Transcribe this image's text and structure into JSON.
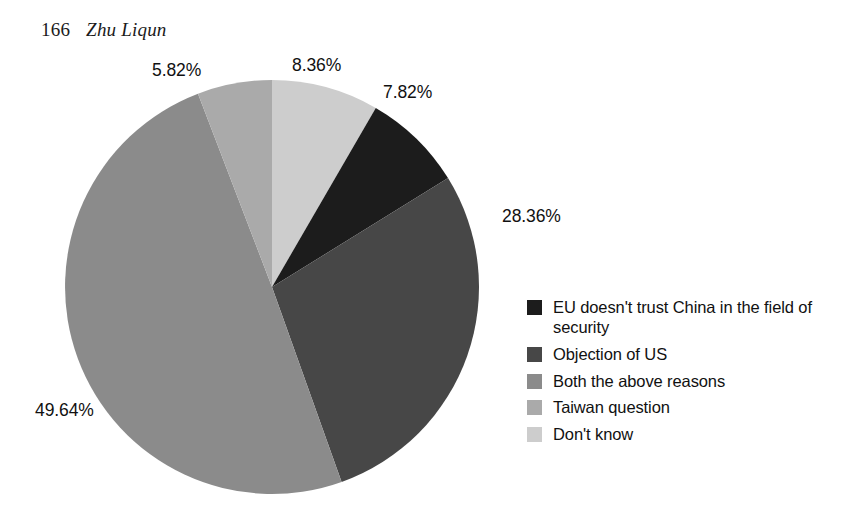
{
  "running_head": {
    "folio": "166",
    "author": "Zhu Liqun"
  },
  "chart_data": {
    "type": "pie",
    "title": "",
    "subtitle": "",
    "xlabel": "",
    "ylabel": "",
    "legend_position": "right",
    "grid": false,
    "units": "percent",
    "total": 100.0,
    "start_angle_deg": 0,
    "direction": "clockwise",
    "categories": [
      "Don't know",
      "EU doesn't trust China in the field of security",
      "Objection of US",
      "Both the above reasons",
      "Taiwan question"
    ],
    "values": [
      8.36,
      7.82,
      28.36,
      49.64,
      5.82
    ],
    "labels": [
      "8.36%",
      "7.82%",
      "28.36%",
      "49.64%",
      "5.82%"
    ],
    "colors": [
      "#cdcdcd",
      "#1c1c1c",
      "#474747",
      "#8b8b8b",
      "#aaaaaa"
    ],
    "slices": [
      {
        "label": "Don't know",
        "value": 8.36,
        "display": "8.36%",
        "color": "#cdcdcd"
      },
      {
        "label": "EU doesn't trust China in the field of security",
        "value": 7.82,
        "display": "7.82%",
        "color": "#1c1c1c"
      },
      {
        "label": "Objection of US",
        "value": 28.36,
        "display": "28.36%",
        "color": "#474747"
      },
      {
        "label": "Both the above reasons",
        "value": 49.64,
        "display": "49.64%",
        "color": "#8b8b8b"
      },
      {
        "label": "Taiwan question",
        "value": 5.82,
        "display": "5.82%",
        "color": "#aaaaaa"
      }
    ]
  },
  "legend": {
    "items": [
      {
        "label": "EU doesn't trust China in the field of security",
        "color": "#1c1c1c"
      },
      {
        "label": "Objection of US",
        "color": "#474747"
      },
      {
        "label": "Both the above reasons",
        "color": "#8b8b8b"
      },
      {
        "label": "Taiwan question",
        "color": "#aaaaaa"
      },
      {
        "label": "Don't know",
        "color": "#cdcdcd"
      }
    ]
  }
}
